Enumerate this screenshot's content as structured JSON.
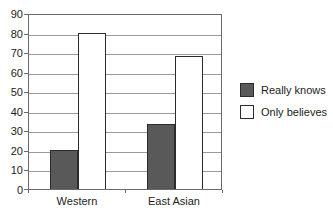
{
  "chart_data": {
    "type": "bar",
    "title": "",
    "xlabel": "",
    "ylabel": "",
    "categories": [
      "Western",
      "East Asian"
    ],
    "series": [
      {
        "name": "Really knows",
        "values": [
          20,
          33
        ],
        "color": "#595959"
      },
      {
        "name": "Only believes",
        "values": [
          80,
          68
        ],
        "color": "#ffffff"
      }
    ],
    "ylim": [
      0,
      90
    ],
    "yticks": [
      0,
      10,
      20,
      30,
      40,
      50,
      60,
      70,
      80,
      90
    ],
    "grid": true,
    "legend_position": "right",
    "colors": {
      "grid": "#9a9a9a",
      "axis": "#6a6a6a",
      "bar_border": "#2b2b2b",
      "text": "#1c1c1c",
      "background": "#ffffff"
    }
  }
}
